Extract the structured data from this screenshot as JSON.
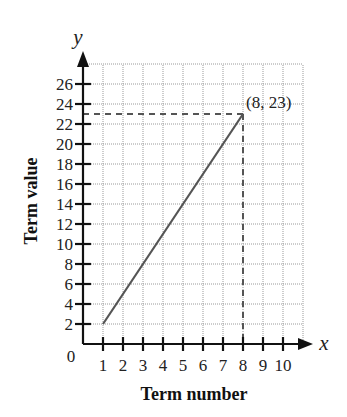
{
  "chart_data": {
    "type": "line",
    "title": "",
    "xlabel": "Term number",
    "ylabel": "Term value",
    "x_var": "x",
    "y_var": "y",
    "origin_label": "0",
    "x": [
      1,
      2,
      3,
      4,
      5,
      6,
      7,
      8
    ],
    "series": [
      {
        "name": "Term value",
        "values": [
          2,
          5,
          8,
          11,
          14,
          17,
          20,
          23
        ]
      }
    ],
    "xticks": [
      1,
      2,
      3,
      4,
      5,
      6,
      7,
      8,
      9,
      10
    ],
    "yticks": [
      2,
      4,
      6,
      8,
      10,
      12,
      14,
      16,
      18,
      20,
      22,
      24,
      26
    ],
    "xlim": [
      0,
      11
    ],
    "ylim": [
      0,
      28
    ],
    "grid": true,
    "annotations": [
      {
        "text": "(8, 23)",
        "x": 8,
        "y": 23,
        "guides": "dashed lines to both axes"
      }
    ],
    "colors": {
      "line": "#555555",
      "grid": "#9a9a9a",
      "axis": "#111111"
    }
  }
}
